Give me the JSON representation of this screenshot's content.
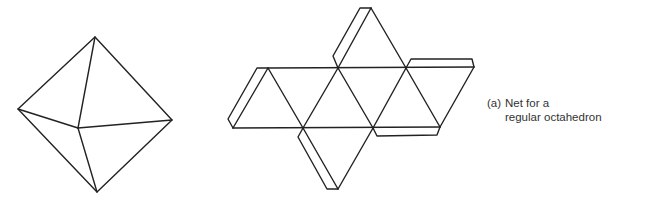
{
  "caption": {
    "label": "(a)",
    "line1": "Net for a",
    "line2": "regular octahedron"
  },
  "figures": {
    "octahedron_3d": {
      "description": "3D wireframe drawing of a regular octahedron",
      "vertices": {
        "top": [
          95,
          37
        ],
        "left": [
          18,
          109
        ],
        "right": [
          172,
          120
        ],
        "center": [
          78,
          128
        ],
        "bottom": [
          97,
          192
        ]
      }
    },
    "net": {
      "description": "Net for a regular octahedron: 8 equilateral triangles with glue tabs",
      "triangle_count": 8,
      "tab_count": 4
    }
  },
  "colors": {
    "line": "#222222",
    "background": "#ffffff",
    "text": "#333333"
  }
}
